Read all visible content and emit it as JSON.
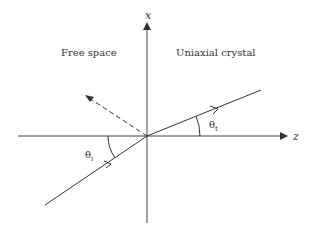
{
  "diagram": {
    "axes": {
      "x_label": "x",
      "z_label": "z"
    },
    "regions": {
      "left": "Free space",
      "right": "Uniaxial crystal"
    },
    "angles": {
      "incident": "θ",
      "incident_sub": "i",
      "transmitted": "θ",
      "transmitted_sub": "t"
    },
    "rays": [
      {
        "name": "incident",
        "style": "solid",
        "from": [
          45,
          205
        ],
        "to": [
          147,
          136
        ]
      },
      {
        "name": "transmitted",
        "style": "solid",
        "from": [
          147,
          136
        ],
        "to": [
          261,
          90
        ]
      },
      {
        "name": "reflected",
        "style": "dashed",
        "from": [
          147,
          136
        ],
        "to": [
          85,
          95
        ]
      }
    ],
    "colors": {
      "line": "#333333",
      "background": "#ffffff"
    }
  }
}
